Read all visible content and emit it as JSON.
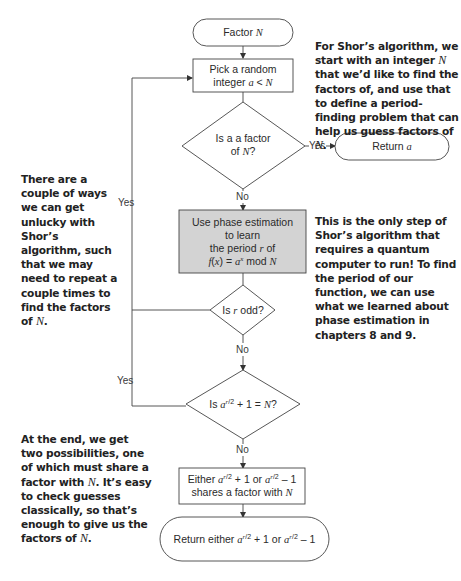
{
  "diagram": {
    "type": "flowchart",
    "colors": {
      "stroke": "#444444",
      "process_fill": "#ffffff",
      "quantum_fill": "#d3d3d3",
      "text": "#2a2a2a"
    },
    "nodes": {
      "start": {
        "shape": "terminal",
        "label": "Factor N"
      },
      "pick": {
        "shape": "process",
        "line1": "Pick a random",
        "line2": "integer a < N"
      },
      "is_factor": {
        "shape": "decision",
        "line1": "Is a a factor",
        "line2": "of N?"
      },
      "return_a": {
        "shape": "terminal",
        "label": "Return a"
      },
      "phase_est": {
        "shape": "process-highlighted",
        "line1": "Use phase estimation",
        "line2": "to learn",
        "line3": "the period r of",
        "line4": "f(x) = a^x mod N"
      },
      "is_odd": {
        "shape": "decision",
        "label": "Is r odd?"
      },
      "is_equal": {
        "shape": "decision",
        "label": "Is a^(r/2) + 1 = N?"
      },
      "either": {
        "shape": "process",
        "line1": "Either a^(r/2) + 1 or a^(r/2) – 1",
        "line2": "shares a factor with N"
      },
      "return_either": {
        "shape": "terminal",
        "label": "Return either a^(r/2) + 1 or a^(r/2) – 1"
      }
    },
    "edges": [
      {
        "from": "start",
        "to": "pick",
        "label": ""
      },
      {
        "from": "pick",
        "to": "is_factor",
        "label": ""
      },
      {
        "from": "is_factor",
        "to": "return_a",
        "label": "Yes"
      },
      {
        "from": "is_factor",
        "to": "phase_est",
        "label": "No"
      },
      {
        "from": "phase_est",
        "to": "is_odd",
        "label": ""
      },
      {
        "from": "is_odd",
        "to": "pick",
        "label": "Yes"
      },
      {
        "from": "is_odd",
        "to": "is_equal",
        "label": "No"
      },
      {
        "from": "is_equal",
        "to": "pick",
        "label": "Yes"
      },
      {
        "from": "is_equal",
        "to": "either",
        "label": "No"
      },
      {
        "from": "either",
        "to": "return_either",
        "label": ""
      }
    ],
    "edge_labels": {
      "yes_factor": "Yes",
      "no_factor": "No",
      "yes_odd": "Yes",
      "no_odd": "No",
      "yes_equal": "Yes",
      "no_equal": "No"
    }
  },
  "annotations": {
    "intro": {
      "before_n": "For Shor’s algorithm, we start with an integer",
      "var": "N",
      "after_n": "that we’d like to find the factors of, and use that to define a period-finding problem that can help us guess factors of",
      "end_var": "N",
      "end": "."
    },
    "unlucky": {
      "text": "There are a couple of ways we can get unlucky with Shor’s algorithm, such that we may need to repeat a couple times to find the factors of",
      "var": "N",
      "end": "."
    },
    "quantum": {
      "text": "This is the only step of Shor’s algorithm that requires a quantum computer to run! To find the period of our function, we can use what we learned about phase estimation in chapters 8 and 9."
    },
    "end": {
      "text1": "At the end, we get two possibilities, one of which must share a factor with",
      "var1": "N",
      "text2": ". It’s easy to check guesses classically, so that’s enough to give us the factors of",
      "var2": "N",
      "end": "."
    }
  }
}
